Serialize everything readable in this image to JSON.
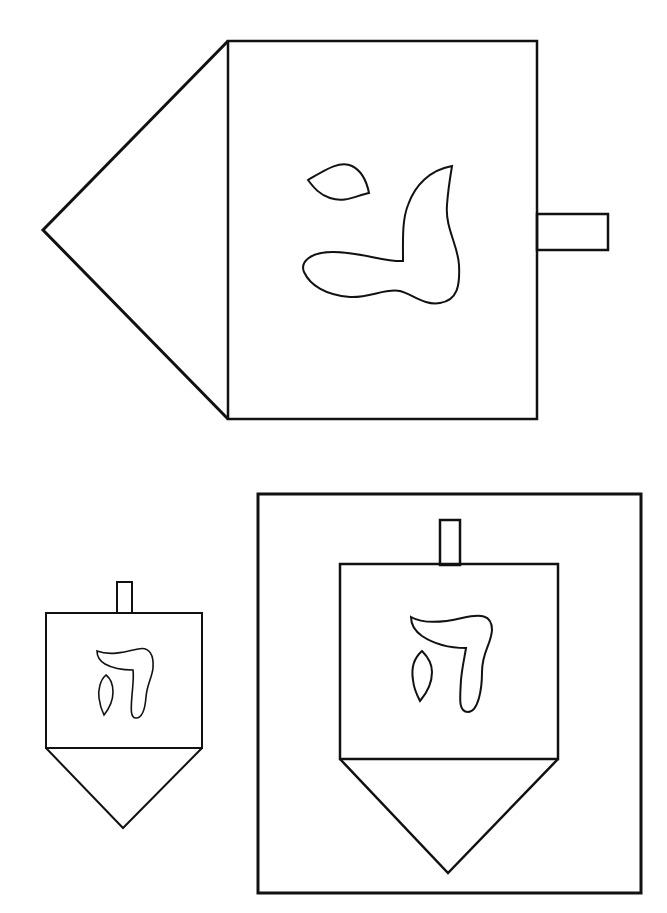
{
  "page": {
    "title": "Dreidel coloring page",
    "background_color": "#ffffff",
    "line_color": "#111111"
  },
  "figures": [
    {
      "id": "large-dreidel-sideways",
      "orientation": "pointing-left",
      "letter": "ג",
      "letter_name": "gimel"
    },
    {
      "id": "small-dreidel",
      "orientation": "upright",
      "letter": "ה",
      "letter_name": "hei"
    },
    {
      "id": "framed-dreidel",
      "orientation": "upright",
      "letter": "ה",
      "letter_name": "hei",
      "framed": true
    }
  ]
}
